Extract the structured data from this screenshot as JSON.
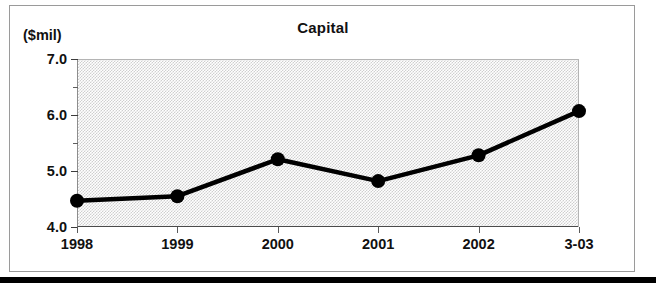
{
  "chart_data": {
    "type": "line",
    "title": "Capital",
    "xlabel": "",
    "ylabel": "($mil)",
    "categories": [
      "1998",
      "1999",
      "2000",
      "2001",
      "2002",
      "3-03"
    ],
    "values": [
      4.47,
      4.55,
      5.21,
      4.82,
      5.28,
      6.07
    ],
    "series": [
      {
        "name": "Capital",
        "values": [
          4.47,
          4.55,
          5.21,
          4.82,
          5.28,
          6.07
        ]
      }
    ],
    "ylim": [
      4.0,
      7.0
    ],
    "y_ticks": [
      "4.0",
      "5.0",
      "6.0",
      "7.0"
    ],
    "y_tick_values": [
      4.0,
      5.0,
      6.0,
      7.0
    ],
    "y_minor_tick_values": [
      4.5,
      5.5,
      6.5
    ],
    "grid": false,
    "legend": "none",
    "marker": "filled-circle",
    "line_color": "#000000",
    "marker_color": "#000000",
    "plot_background": "#cfcfcf",
    "frame_color": "#9a9a9a"
  },
  "figure": {
    "title": "Capital",
    "unit_caption": "($mil)"
  },
  "axes": {
    "y": {
      "ticks": [
        {
          "label": "7.0",
          "value": 7.0
        },
        {
          "label": "6.0",
          "value": 6.0
        },
        {
          "label": "5.0",
          "value": 5.0
        },
        {
          "label": "4.0",
          "value": 4.0
        }
      ]
    },
    "x": {
      "ticks": [
        {
          "label": "1998"
        },
        {
          "label": "1999"
        },
        {
          "label": "2000"
        },
        {
          "label": "2001"
        },
        {
          "label": "2002"
        },
        {
          "label": "3-03"
        }
      ]
    }
  }
}
